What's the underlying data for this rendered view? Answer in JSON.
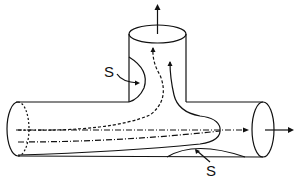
{
  "diagram": {
    "labels": {
      "upper_separation": "S",
      "lower_separation": "S"
    },
    "colors": {
      "stroke": "#111111",
      "background": "#ffffff"
    }
  }
}
